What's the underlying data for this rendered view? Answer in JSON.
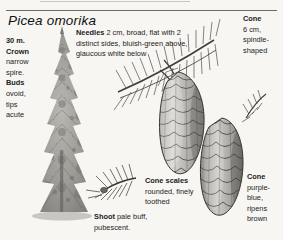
{
  "page": {
    "species_title": "Picea omorika",
    "background_color": "#f7f6f2",
    "ink_color": "#1c1c1c"
  },
  "labels": {
    "crown": {
      "heading": "30 m.",
      "subheading_1": "Crown",
      "body_1": "narrow",
      "body_2": "spire.",
      "subheading_2": "Buds",
      "body_3": "ovoid,",
      "body_4": "tips",
      "body_5": "acute"
    },
    "needles": {
      "heading": "Needles",
      "body": "2 cm, broad, flat with 2 distinct sides, bluish-green above, glaucous white below"
    },
    "cone_top_right": {
      "heading": "Cone",
      "body": "6 cm, spindle-shaped"
    },
    "cone_scales": {
      "heading": "Cone scales",
      "body": "rounded, finely toothed"
    },
    "cone_bottom_right": {
      "heading": "Cone",
      "body": "purple-blue, ripens brown"
    },
    "shoot": {
      "heading": "Shoot",
      "body": "pale buff, pubescent."
    }
  },
  "illustrations": [
    {
      "name": "tree-silhouette",
      "description": "narrow spire conifer, full habit"
    },
    {
      "name": "needled-branch",
      "description": "shoot with radiating flat needles"
    },
    {
      "name": "cone-upper",
      "description": "spindle-shaped cone with overlapping scales"
    },
    {
      "name": "cone-lower",
      "description": "second spindle-shaped cone, scales rounded"
    },
    {
      "name": "shoot-detail",
      "description": "shoot tip with needles, pubescent"
    }
  ]
}
